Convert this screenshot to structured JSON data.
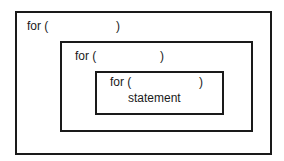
{
  "diagram": {
    "outer": {
      "keyword": "for (",
      "close": ")"
    },
    "middle": {
      "keyword": "for (",
      "close": ")"
    },
    "inner": {
      "keyword": "for (",
      "close": ")",
      "body": "statement"
    },
    "colors": {
      "stroke": "#1a1a1a",
      "background": "#ffffff"
    }
  }
}
